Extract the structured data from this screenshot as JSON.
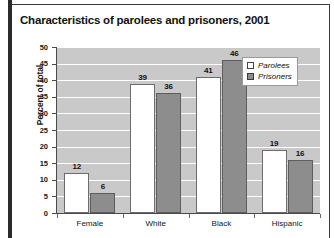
{
  "chart_data": {
    "type": "bar",
    "title": "Characteristics of parolees and prisoners, 2001",
    "xlabel": "",
    "ylabel": "Percent of total",
    "categories": [
      "Female",
      "White",
      "Black",
      "Hispanic"
    ],
    "series": [
      {
        "name": "Parolees",
        "values": [
          12,
          39,
          41,
          19
        ],
        "color": "#ffffff"
      },
      {
        "name": "Prisoners",
        "values": [
          6,
          36,
          46,
          16
        ],
        "color": "#8d8d8d"
      }
    ],
    "ylim": [
      0,
      50
    ],
    "yticks": [
      0,
      5,
      10,
      15,
      20,
      25,
      30,
      35,
      40,
      45,
      50
    ],
    "ytick_labels": [
      "0",
      "5",
      "10",
      "15",
      "20",
      "25",
      "30",
      "35",
      "40",
      "45",
      "50"
    ],
    "grid": true,
    "grid_color": "#ffffff",
    "plot_background": "#c9c9c9",
    "legend_position": "top-right",
    "legend_entries": [
      "Parolees",
      "Prisoners"
    ]
  }
}
